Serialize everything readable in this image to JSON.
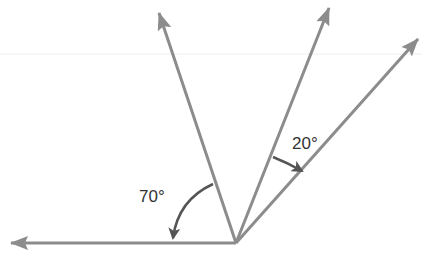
{
  "diagram": {
    "colors": {
      "ray": "#8c8c8c",
      "arc": "#555555",
      "text": "#333333",
      "guide": "#eeeeee"
    },
    "vertex": {
      "x": 236,
      "y": 243
    },
    "rays": [
      {
        "id": "left-ray",
        "tip": {
          "x": 11,
          "y": 243
        }
      },
      {
        "id": "upper-left-ray",
        "tip": {
          "x": 159,
          "y": 13
        }
      },
      {
        "id": "upper-middle-ray",
        "tip": {
          "x": 329,
          "y": 8
        }
      },
      {
        "id": "upper-right-ray",
        "tip": {
          "x": 418,
          "y": 39
        }
      }
    ],
    "angles": [
      {
        "id": "angle-70",
        "label": "70°",
        "between": [
          "upper-left-ray",
          "left-ray"
        ]
      },
      {
        "id": "angle-20",
        "label": "20°",
        "between": [
          "upper-middle-ray",
          "upper-right-ray"
        ]
      }
    ]
  }
}
